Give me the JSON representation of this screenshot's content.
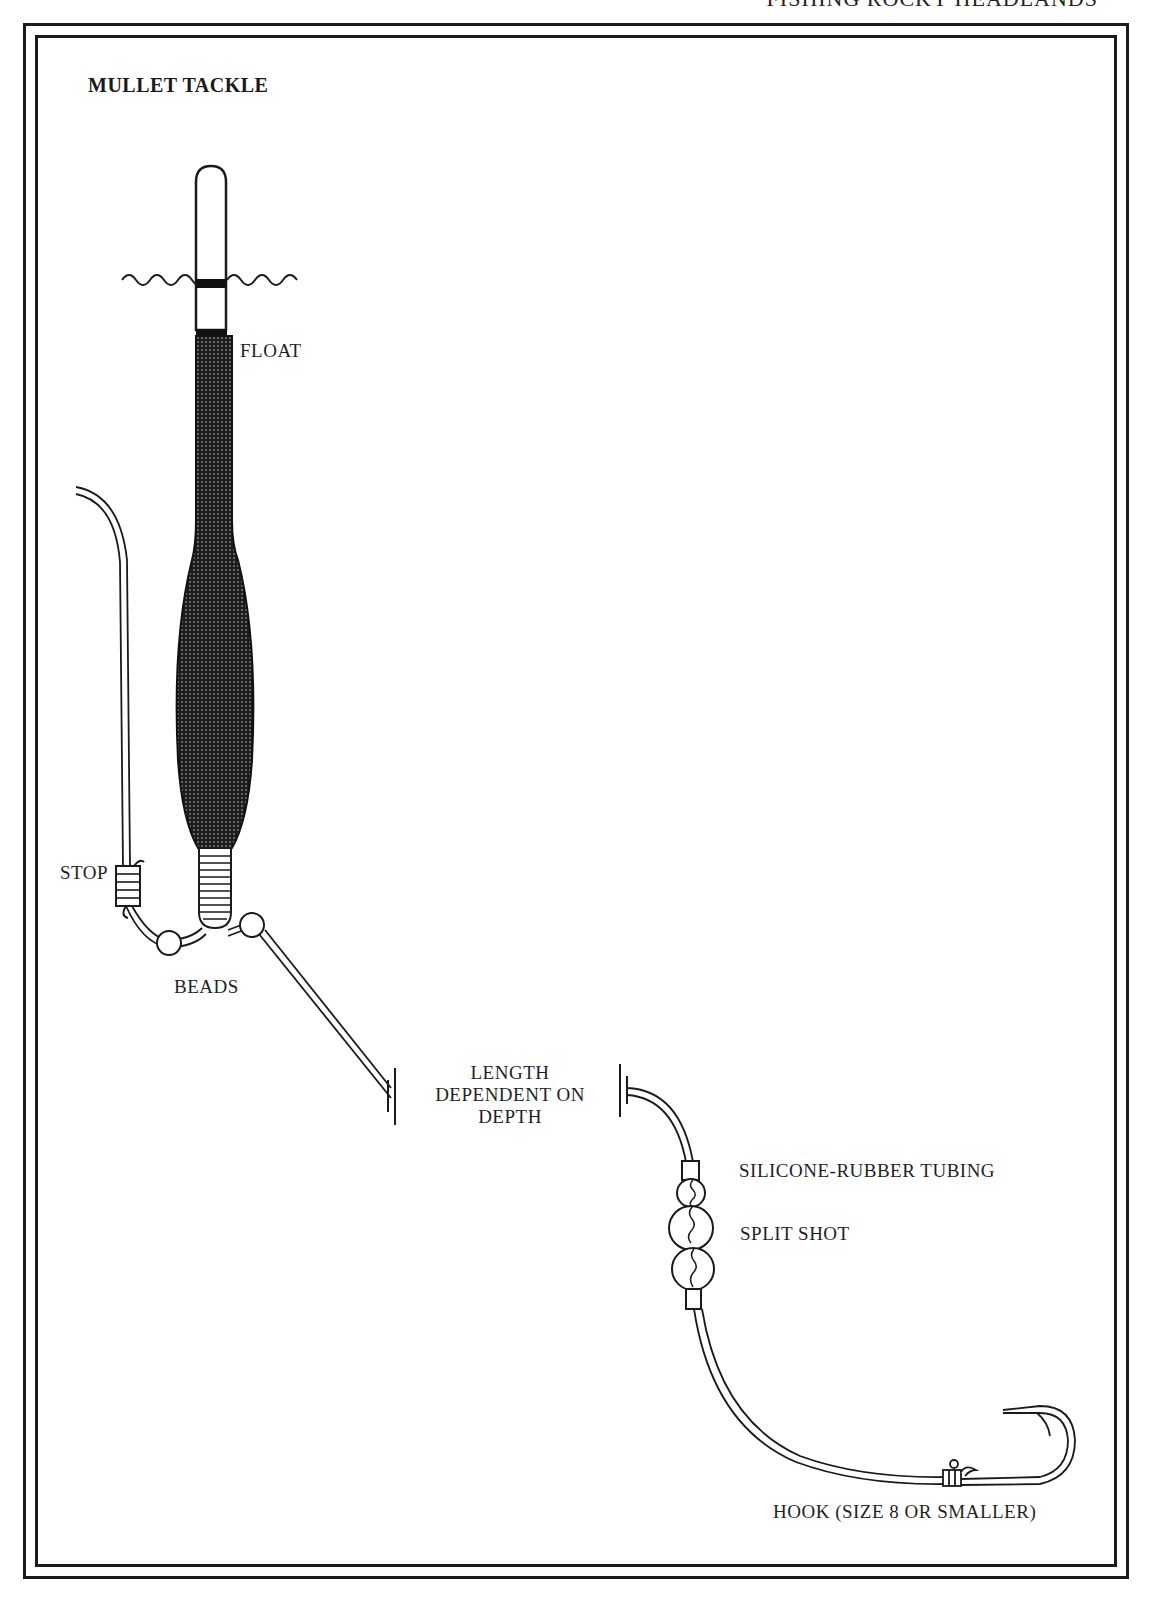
{
  "page": {
    "running_head": "FISHING ROCKY HEADLANDS"
  },
  "diagram": {
    "title": "MULLET TACKLE",
    "labels": {
      "float": "FLOAT",
      "stop": "STOP",
      "beads": "BEADS",
      "length_line1": "LENGTH",
      "length_line2": "DEPENDENT ON",
      "length_line3": "DEPTH",
      "tubing": "SILICONE-RUBBER TUBING",
      "split_shot": "SPLIT SHOT",
      "hook": "HOOK (SIZE 8 OR SMALLER)"
    },
    "components": [
      {
        "name": "float",
        "description": "long slender float with white tip, black waterline band and dark stippled body swelling to a bulb"
      },
      {
        "name": "water-surface",
        "description": "wavy line crossing the float tip"
      },
      {
        "name": "stop",
        "description": "stop knot whipped onto the main line"
      },
      {
        "name": "beads",
        "description": "two beads either side of the float eye"
      },
      {
        "name": "leader-break",
        "description": "line break marker indicating length dependent on depth"
      },
      {
        "name": "silicone-rubber-tubing",
        "description": "short tubing sleeves above and below the split shot"
      },
      {
        "name": "split-shot",
        "description": "three split shot pinched on the line"
      },
      {
        "name": "hook",
        "description": "size 8 or smaller hook tied to the end of the line"
      }
    ],
    "colors": {
      "ink": "#1a1a1a",
      "paper": "#ffffff",
      "float_body": "#2a2a2a"
    }
  }
}
